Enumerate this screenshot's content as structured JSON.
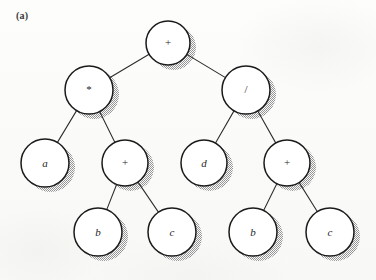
{
  "figure": {
    "panel_label": "(a)",
    "caption": "",
    "background_color": "#fbfbf9",
    "node_fill_color": "#ffffff",
    "node_stroke_color": "#1a1a1a",
    "shadow_color": "#9a9a9a",
    "edge_color": "#2b2b2b",
    "label_color": "#1f1f1f"
  },
  "tree": {
    "expression": "a * (b + c) / (d + (b + c))",
    "nodes": [
      {
        "id": "n0",
        "label": "+",
        "kind": "operator",
        "level": 0,
        "cx": 168,
        "cy": 43,
        "r": 22
      },
      {
        "id": "n1",
        "label": "*",
        "kind": "operator",
        "level": 1,
        "cx": 89,
        "cy": 90,
        "r": 24
      },
      {
        "id": "n2",
        "label": "/",
        "kind": "operator",
        "level": 1,
        "cx": 246,
        "cy": 90,
        "r": 24
      },
      {
        "id": "n3",
        "label": "a",
        "kind": "operand",
        "level": 2,
        "cx": 45,
        "cy": 163,
        "r": 24
      },
      {
        "id": "n4",
        "label": "+",
        "kind": "operator",
        "level": 2,
        "cx": 125,
        "cy": 163,
        "r": 23
      },
      {
        "id": "n5",
        "label": "d",
        "kind": "operand",
        "level": 2,
        "cx": 204,
        "cy": 163,
        "r": 23
      },
      {
        "id": "n6",
        "label": "+",
        "kind": "operator",
        "level": 2,
        "cx": 287,
        "cy": 163,
        "r": 23
      },
      {
        "id": "n7",
        "label": "b",
        "kind": "operand",
        "level": 3,
        "cx": 98,
        "cy": 232,
        "r": 24
      },
      {
        "id": "n8",
        "label": "c",
        "kind": "operand",
        "level": 3,
        "cx": 172,
        "cy": 232,
        "r": 24
      },
      {
        "id": "n9",
        "label": "b",
        "kind": "operand",
        "level": 3,
        "cx": 253,
        "cy": 232,
        "r": 24
      },
      {
        "id": "n10",
        "label": "c",
        "kind": "operand",
        "level": 3,
        "cx": 330,
        "cy": 232,
        "r": 24
      }
    ],
    "edges": [
      {
        "from": "n0",
        "to": "n1"
      },
      {
        "from": "n0",
        "to": "n2"
      },
      {
        "from": "n1",
        "to": "n3"
      },
      {
        "from": "n1",
        "to": "n4"
      },
      {
        "from": "n2",
        "to": "n5"
      },
      {
        "from": "n2",
        "to": "n6"
      },
      {
        "from": "n4",
        "to": "n7"
      },
      {
        "from": "n4",
        "to": "n8"
      },
      {
        "from": "n6",
        "to": "n9"
      },
      {
        "from": "n6",
        "to": "n10"
      }
    ]
  }
}
